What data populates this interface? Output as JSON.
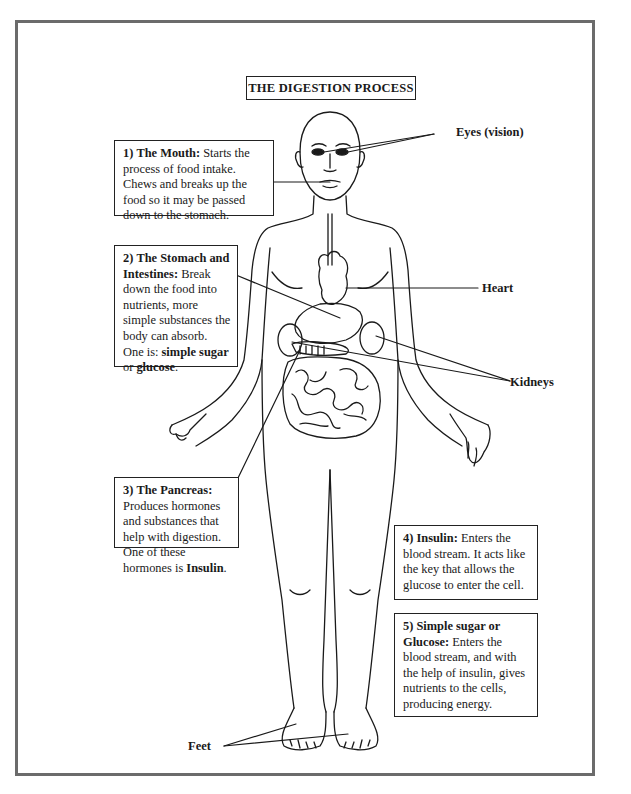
{
  "figure": {
    "title": "THE DIGESTION PROCESS",
    "callouts": [
      {
        "id": "mouth",
        "number": "1)",
        "heading": "The Mouth:",
        "body": " Starts the process of food intake. Chews and breaks up the food so it may be passed down to the stomach."
      },
      {
        "id": "stomach-intestines",
        "number": "2)",
        "heading": "The Stomach and Intestines:",
        "body_pre": " Break down the food into nutrients, more simple substances the body can absorb. One is: ",
        "bold_1": "simple sugar",
        "mid": " or ",
        "bold_2": "glucose",
        "end": "."
      },
      {
        "id": "pancreas",
        "number": "3)",
        "heading": "The Pancreas:",
        "body_pre": " Produces hormones and substances that help with digestion. One of these hormones is ",
        "bold_1": "Insulin",
        "end": "."
      },
      {
        "id": "insulin",
        "number": "4)",
        "heading": "Insulin:",
        "body": " Enters the blood stream. It acts like the key that allows the glucose to enter the cell."
      },
      {
        "id": "glucose",
        "number": "5)",
        "heading": "Simple sugar or Glucose:",
        "body": " Enters the blood stream, and with the help of insulin, gives nutrients to the cells, producing energy."
      }
    ],
    "labels": {
      "eyes": "Eyes (vision)",
      "heart": "Heart",
      "kidneys": "Kidneys",
      "feet": "Feet"
    },
    "colors": {
      "frame": "#6b6b6b",
      "ink": "#1a1a1a",
      "background": "#ffffff"
    }
  }
}
